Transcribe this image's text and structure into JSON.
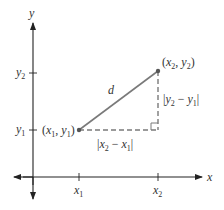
{
  "diagram": {
    "colors": {
      "axis": "#222222",
      "segment": "#7a7a7a",
      "dashed": "#7a7a7a",
      "point": "#555555",
      "text": "#333333"
    },
    "axes": {
      "x_label": "x",
      "y_label": "y",
      "x_ticks": [
        {
          "base": "x",
          "sub": "1"
        },
        {
          "base": "x",
          "sub": "2"
        }
      ],
      "y_ticks": [
        {
          "base": "y",
          "sub": "2"
        },
        {
          "base": "y",
          "sub": "1"
        }
      ]
    },
    "points": {
      "p1": {
        "open": "(",
        "x": "x",
        "xs": "1",
        "comma": ", ",
        "y": "y",
        "ys": "1",
        "close": ")"
      },
      "p2": {
        "open": "(",
        "x": "x",
        "xs": "2",
        "comma": ", ",
        "y": "y",
        "ys": "2",
        "close": ")"
      }
    },
    "segment_label": "d",
    "horizontal_label": {
      "bar1": "|",
      "a": "x",
      "as": "2",
      "minus": " − ",
      "b": "x",
      "bs": "1",
      "bar2": "|"
    },
    "vertical_label": {
      "bar1": "|",
      "a": "y",
      "as": "2",
      "minus": " − ",
      "b": "y",
      "bs": "1",
      "bar2": "|"
    }
  }
}
